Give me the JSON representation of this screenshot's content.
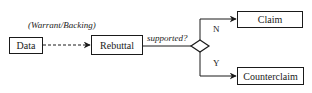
{
  "diagram": {
    "annotation": "(Warrant/Backing)",
    "decision_label": "supported?",
    "nodes": {
      "data": "Data",
      "rebuttal": "Rebuttal",
      "claim": "Claim",
      "counterclaim": "Counterclaim"
    },
    "branches": {
      "no": "N",
      "yes": "Y"
    },
    "edges": [
      {
        "from": "Data",
        "to": "Rebuttal",
        "style": "dashed",
        "label": "(Warrant/Backing)"
      },
      {
        "from": "Rebuttal",
        "to": "decision",
        "style": "solid",
        "label": "supported?"
      },
      {
        "from": "decision",
        "to": "Claim",
        "style": "solid",
        "label": "N"
      },
      {
        "from": "decision",
        "to": "Counterclaim",
        "style": "solid",
        "label": "Y"
      }
    ],
    "colors": {
      "stroke": "#1a1a1a",
      "background": "#ffffff"
    }
  }
}
